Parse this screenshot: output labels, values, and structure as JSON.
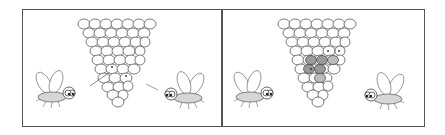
{
  "illustration": {
    "description": "Two-panel cartoon: two flies beside a cone-shaped cluster of cells; in the second panel a group of cells is shaded",
    "panels": [
      {
        "label": "panel-1",
        "shaded_cells": 0,
        "marked_cells": 2
      },
      {
        "label": "panel-2",
        "shaded_cells": 6,
        "marked_cells": 3
      }
    ],
    "colors": {
      "outline": "#444444",
      "shade": "#9a9a9a",
      "fly_body": "#d6d6d6",
      "background": "#ffffff"
    }
  }
}
